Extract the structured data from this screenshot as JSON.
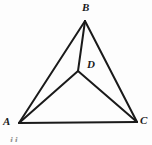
{
  "figure": {
    "background_color": "#fdfdfd",
    "stroke_color": "#1a1a1a",
    "stroke_width": 2,
    "width": 152,
    "height": 145,
    "points": {
      "A": {
        "label": "A",
        "x": 19,
        "y": 123
      },
      "B": {
        "label": "B",
        "x": 85,
        "y": 21
      },
      "C": {
        "label": "C",
        "x": 137,
        "y": 122
      },
      "D": {
        "label": "D",
        "x": 78,
        "y": 71
      }
    },
    "segments": [
      {
        "name": "AB",
        "from": "A",
        "to": "B"
      },
      {
        "name": "BC",
        "from": "B",
        "to": "C"
      },
      {
        "name": "AC",
        "from": "A",
        "to": "C"
      },
      {
        "name": "BD",
        "from": "B",
        "to": "D"
      },
      {
        "name": "AD",
        "from": "A",
        "to": "D"
      },
      {
        "name": "DC",
        "from": "D",
        "to": "C"
      }
    ],
    "artifact": {
      "label": "ii",
      "description": "faint clipped glyph at bottom left edge"
    }
  }
}
